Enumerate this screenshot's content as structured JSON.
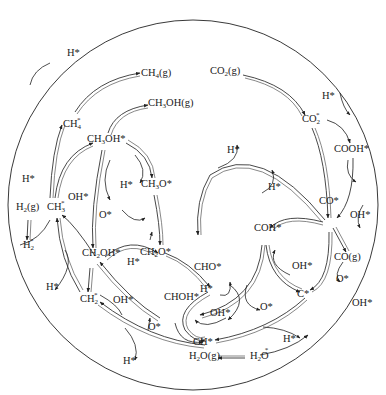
{
  "diagram": {
    "species": [
      {
        "id": "co2g",
        "text": "CO",
        "sub": "2",
        "tail": "(g)"
      },
      {
        "id": "co2s",
        "text": "CO",
        "sub": "2",
        "sup": "*"
      },
      {
        "id": "cooh",
        "text": "COOH*"
      },
      {
        "id": "co",
        "text": "CO*"
      },
      {
        "id": "cog",
        "text": "CO(g)"
      },
      {
        "id": "coh",
        "text": "COH*"
      },
      {
        "id": "cho",
        "text": "CHO*"
      },
      {
        "id": "chohs",
        "text": "CHOH*"
      },
      {
        "id": "ch2o",
        "text": "CH",
        "sub": "2",
        "tail": "O*"
      },
      {
        "id": "ch2oh",
        "text": "CH",
        "sub": "2",
        "tail": "OH*"
      },
      {
        "id": "ch3o",
        "text": "CH",
        "sub": "3",
        "tail": "O*"
      },
      {
        "id": "ch3oh",
        "text": "CH",
        "sub": "3",
        "tail": "OH*"
      },
      {
        "id": "ch3ohg",
        "text": "CH",
        "sub": "3",
        "tail": "OH(g)"
      },
      {
        "id": "ch4s",
        "text": "CH",
        "sub": "4",
        "sup": "*"
      },
      {
        "id": "ch4g",
        "text": "CH",
        "sub": "4",
        "tail": "(g)"
      },
      {
        "id": "ch3s",
        "text": "CH",
        "sub": "3",
        "sup": "*"
      },
      {
        "id": "ch2s",
        "text": "CH",
        "sub": "2",
        "sup": "*"
      },
      {
        "id": "chs",
        "text": "CH*"
      },
      {
        "id": "cs",
        "text": "C*"
      },
      {
        "id": "h2g",
        "text": "H",
        "sub": "2",
        "tail": "(g)"
      },
      {
        "id": "h2s",
        "text": "H",
        "sub": "2",
        "sup": "*"
      },
      {
        "id": "h2og",
        "text": "H",
        "sub": "2",
        "tail": "O(g)"
      },
      {
        "id": "h2os",
        "text": "H",
        "sub": "2",
        "tail": "O",
        "sup": "*"
      }
    ],
    "reagents": {
      "h_star": "H*",
      "oh_star": "OH*",
      "o_star": "O*"
    }
  }
}
